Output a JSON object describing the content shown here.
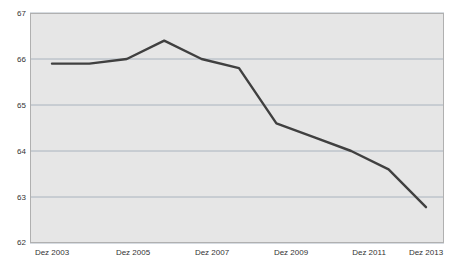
{
  "chart_data": {
    "type": "line",
    "title": "",
    "subtitle": "",
    "xlabel": "",
    "ylabel": "",
    "x": [
      "Dez 2003",
      "Dez 2004",
      "Dez 2005",
      "Dez 2006",
      "Dez 2007",
      "Dez 2008",
      "Dez 2009",
      "Dez 2010",
      "Dez 2011",
      "Dez 2012",
      "Dez 2013"
    ],
    "values": [
      65.9,
      65.9,
      66.0,
      66.4,
      66.0,
      65.8,
      64.6,
      64.3,
      64.0,
      63.6,
      62.78
    ],
    "series": [
      {
        "name": "",
        "values": [
          65.9,
          65.9,
          66.0,
          66.4,
          66.0,
          65.8,
          64.6,
          64.3,
          64.0,
          63.6,
          62.78
        ],
        "color": "#404040"
      }
    ],
    "ylim": [
      62,
      67
    ],
    "xlim": [
      2003,
      2013
    ],
    "yticks": [
      67,
      66,
      65,
      64,
      63,
      62
    ],
    "ytick_labels": [
      "67",
      "66",
      "65",
      "64",
      "63",
      "62"
    ],
    "xticks": [
      2003,
      2005,
      2007,
      2009,
      2011,
      2013
    ],
    "xtick_labels": [
      "Dez 2003",
      "Dez 2005",
      "Dez 2007",
      "Dez 2009",
      "Dez 2011",
      "Dez 2013"
    ],
    "grid": true,
    "grid_axis": "y",
    "legend": false,
    "legend_position": "none",
    "annotations": [],
    "colors": {
      "line": "#404040",
      "plot_background": "#e6e6e6",
      "figure_background": "#ffffff",
      "gridline": "#9aa6b4",
      "border": "#b0b0b0",
      "tick_text": "#333333"
    }
  }
}
